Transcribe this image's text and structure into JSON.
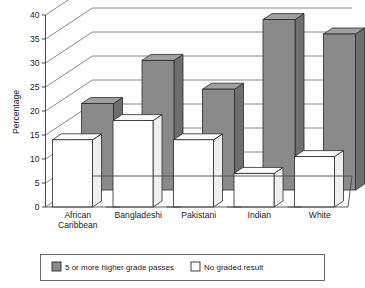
{
  "chart_data": {
    "type": "bar",
    "title": "",
    "subtitle": "",
    "xlabel": "",
    "ylabel": "Percentage",
    "ylim": [
      0,
      40
    ],
    "ytick_step": 5,
    "yticks": [
      "0",
      "5",
      "10",
      "15",
      "20",
      "25",
      "30",
      "35",
      "40"
    ],
    "grid": true,
    "three_d": true,
    "legend_position": "bottom",
    "categories": [
      "African\nCaribbean",
      "Bangladeshi",
      "Pakistani",
      "Indian",
      "White"
    ],
    "category_lines": [
      [
        "African",
        "Caribbean"
      ],
      [
        "Bangladeshi"
      ],
      [
        "Pakistani"
      ],
      [
        "Indian"
      ],
      [
        "White"
      ]
    ],
    "series": [
      {
        "name": "5 or more higher grade passes",
        "color": "#8a8a8a",
        "values": [
          18,
          27,
          21,
          35.5,
          32.5
        ]
      },
      {
        "name": "No graded result",
        "color": "#ffffff",
        "values": [
          14,
          18,
          14,
          7,
          10.5
        ]
      }
    ]
  },
  "legend": {
    "items": [
      {
        "label": "5 or more higher grade passes",
        "swatch": "gray"
      },
      {
        "label": "No graded result",
        "swatch": "white"
      }
    ]
  },
  "axes": {
    "y_title": "Percentage"
  },
  "colors": {
    "series_gray": "#8a8a8a",
    "series_white": "#ffffff",
    "axis": "#4a4a4a",
    "grid": "#6b6b6b",
    "text": "#1a1a1a"
  }
}
